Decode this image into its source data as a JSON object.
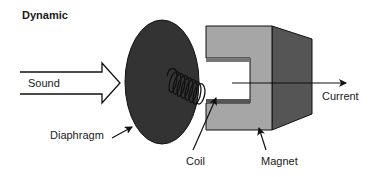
{
  "diagram": {
    "title": "Dynamic",
    "labels": {
      "sound": "Sound",
      "diaphragm": "Diaphragm",
      "coil": "Coil",
      "magnet": "Magnet",
      "current": "Current"
    },
    "colors": {
      "diaphragm_fill": "#333333",
      "magnet_front": "#a6a6a6",
      "magnet_side": "#555555",
      "stroke": "#111111",
      "background": "#ffffff"
    }
  }
}
